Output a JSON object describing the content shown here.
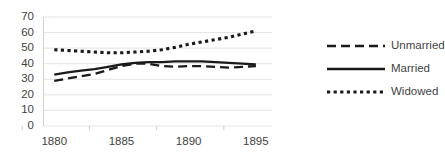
{
  "chart_data": {
    "type": "line",
    "title": "",
    "xlabel": "",
    "ylabel": "",
    "xlim": [
      1879,
      1896
    ],
    "ylim": [
      0,
      70
    ],
    "ytick_values": [
      70,
      60,
      50,
      40,
      30,
      20,
      10,
      0
    ],
    "xtick_values": [
      1880,
      1885,
      1890,
      1895
    ],
    "grid": "horizontal",
    "legend_position": "right",
    "x": [
      1880,
      1881,
      1882,
      1883,
      1884,
      1885,
      1886,
      1887,
      1888,
      1889,
      1890,
      1891,
      1892,
      1893,
      1894,
      1895
    ],
    "series": [
      {
        "name": "Unmarried",
        "style": "dashed",
        "color": "#1a1a1a",
        "values": [
          29,
          30.5,
          32,
          33.5,
          36,
          38.5,
          40,
          40,
          38.5,
          38,
          38.5,
          38.5,
          38,
          37.5,
          38,
          38.5
        ]
      },
      {
        "name": "Married",
        "style": "solid",
        "color": "#1a1a1a",
        "values": [
          33,
          34.5,
          35.5,
          36.5,
          38,
          39.5,
          40.5,
          41,
          41,
          41.5,
          41.5,
          41.5,
          41,
          40.5,
          40,
          39.5
        ]
      },
      {
        "name": "Widowed",
        "style": "dotted",
        "color": "#1a1a1a",
        "values": [
          49,
          48.5,
          48,
          47.5,
          47,
          47,
          47.5,
          48,
          49,
          50.5,
          52.5,
          54,
          55.5,
          57,
          59,
          61
        ]
      }
    ]
  },
  "axes": {
    "ytick_labels": [
      "70",
      "60",
      "50",
      "40",
      "30",
      "20",
      "10",
      "0"
    ],
    "xtick_labels": [
      "1880",
      "1885",
      "1890",
      "1895"
    ]
  },
  "legend": {
    "items": [
      {
        "label": "Unmarried",
        "style": "dashed"
      },
      {
        "label": "Married",
        "style": "solid"
      },
      {
        "label": "Widowed",
        "style": "dotted"
      }
    ]
  },
  "colors": {
    "line": "#1a1a1a",
    "gridline": "#e4e4e4",
    "axis": "#d0d0d0",
    "text": "#3f3f3f",
    "background": "#ffffff"
  }
}
